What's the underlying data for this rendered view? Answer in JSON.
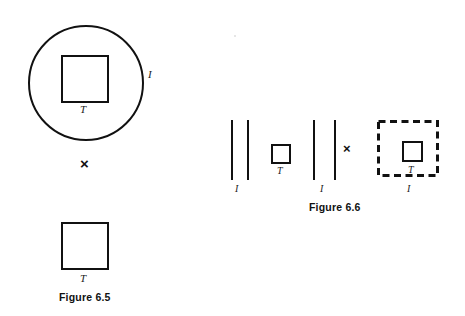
{
  "page": {
    "background_color": "#ffffff",
    "ink_color": "#111111",
    "width": 465,
    "height": 316
  },
  "figure_65": {
    "caption": "Figure 6.5",
    "circle": {
      "name": "interval-circle",
      "boundary_label": "I"
    },
    "inscribed_square": {
      "name": "tile-square-in-circle",
      "label": "T"
    },
    "operator": "×",
    "result_square": {
      "name": "tile-square-result",
      "label": "T"
    }
  },
  "figure_66": {
    "caption": "Figure 6.6",
    "left_group": {
      "bar_left_label": "I",
      "bars": [
        "|",
        "|"
      ],
      "square_label": "T"
    },
    "right_group": {
      "bar_right_label": "I",
      "bars": [
        "|",
        "|"
      ]
    },
    "operator": "×",
    "dashed_region": {
      "name": "dashed-interval-square",
      "boundary_label": "I",
      "inner_square_label": "T"
    }
  }
}
